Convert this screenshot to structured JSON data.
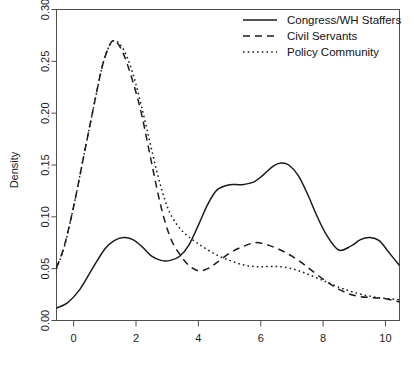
{
  "chart_data": {
    "type": "line",
    "title": "",
    "subtitle": "",
    "xlabel": "",
    "ylabel": "Density",
    "xlim": [
      -0.55,
      10.45
    ],
    "ylim": [
      0.0,
      0.3
    ],
    "xticks": [
      0,
      2,
      4,
      6,
      8,
      10
    ],
    "xtick_labels": [
      "0",
      "2",
      "4",
      "6",
      "8",
      "10"
    ],
    "yticks": [
      0.0,
      0.05,
      0.1,
      0.15,
      0.2,
      0.25,
      0.3
    ],
    "ytick_labels": [
      "0.00",
      "0.05",
      "0.10",
      "0.15",
      "0.20",
      "0.25",
      "0.30"
    ],
    "grid": false,
    "legend_position": "top-right",
    "legend_entries": [
      {
        "label": "Congress/WH Staffers",
        "style": "solid"
      },
      {
        "label": "Civil Servants",
        "style": "dashed"
      },
      {
        "label": "Policy Community",
        "style": "dotted"
      }
    ],
    "series": [
      {
        "name": "Congress/WH Staffers",
        "style": "solid",
        "x": [
          -0.55,
          -0.2,
          0.2,
          0.6,
          1.0,
          1.3,
          1.6,
          1.9,
          2.2,
          2.5,
          2.8,
          3.1,
          3.4,
          3.7,
          4.0,
          4.3,
          4.6,
          5.0,
          5.4,
          5.8,
          6.1,
          6.4,
          6.65,
          6.9,
          7.2,
          7.5,
          7.8,
          8.1,
          8.5,
          8.9,
          9.2,
          9.5,
          9.8,
          10.1,
          10.45
        ],
        "y": [
          0.012,
          0.017,
          0.03,
          0.05,
          0.069,
          0.077,
          0.08,
          0.078,
          0.071,
          0.062,
          0.058,
          0.058,
          0.062,
          0.073,
          0.092,
          0.112,
          0.126,
          0.131,
          0.131,
          0.134,
          0.141,
          0.149,
          0.152,
          0.15,
          0.14,
          0.122,
          0.101,
          0.083,
          0.068,
          0.072,
          0.078,
          0.08,
          0.077,
          0.066,
          0.053
        ]
      },
      {
        "name": "Civil Servants",
        "style": "dashed",
        "x": [
          -0.55,
          -0.3,
          0.0,
          0.3,
          0.6,
          0.9,
          1.1,
          1.25,
          1.4,
          1.6,
          1.8,
          2.0,
          2.2,
          2.5,
          2.8,
          3.1,
          3.4,
          3.7,
          4.0,
          4.3,
          4.6,
          5.0,
          5.4,
          5.8,
          6.1,
          6.4,
          6.7,
          7.0,
          7.3,
          7.6,
          8.0,
          8.4,
          8.8,
          9.2,
          9.6,
          10.0,
          10.45
        ],
        "y": [
          0.051,
          0.072,
          0.11,
          0.155,
          0.2,
          0.243,
          0.262,
          0.27,
          0.268,
          0.257,
          0.24,
          0.22,
          0.196,
          0.152,
          0.11,
          0.08,
          0.064,
          0.053,
          0.048,
          0.05,
          0.056,
          0.065,
          0.071,
          0.075,
          0.074,
          0.071,
          0.067,
          0.062,
          0.056,
          0.049,
          0.04,
          0.032,
          0.026,
          0.023,
          0.022,
          0.021,
          0.018
        ]
      },
      {
        "name": "Policy Community",
        "style": "dotted",
        "x": [
          -0.55,
          -0.3,
          0.0,
          0.3,
          0.6,
          0.9,
          1.1,
          1.3,
          1.5,
          1.7,
          1.9,
          2.1,
          2.4,
          2.7,
          3.0,
          3.3,
          3.6,
          3.9,
          4.2,
          4.6,
          5.0,
          5.4,
          5.8,
          6.2,
          6.6,
          7.0,
          7.4,
          7.8,
          8.2,
          8.6,
          9.0,
          9.4,
          9.8,
          10.1,
          10.45
        ],
        "y": [
          0.05,
          0.071,
          0.11,
          0.155,
          0.2,
          0.243,
          0.262,
          0.27,
          0.266,
          0.255,
          0.238,
          0.216,
          0.178,
          0.14,
          0.11,
          0.093,
          0.083,
          0.076,
          0.07,
          0.063,
          0.058,
          0.054,
          0.052,
          0.052,
          0.052,
          0.05,
          0.046,
          0.041,
          0.036,
          0.031,
          0.027,
          0.024,
          0.022,
          0.021,
          0.02
        ]
      }
    ]
  },
  "axes": {
    "y_title": "Density"
  }
}
